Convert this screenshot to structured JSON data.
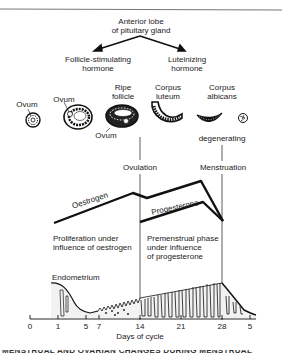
{
  "pituitary": {
    "title_line1": "Anterior lobe",
    "title_line2": "of pituitary gland",
    "fsh_line1": "Follicle-stimulating",
    "fsh_line2": "hormone",
    "lh_line1": "Luteinizing",
    "lh_line2": "hormone"
  },
  "ovary_stages": {
    "ovum_1": "Ovum",
    "ovum_2": "Ovum",
    "ripe_follicle_line1": "Ripe",
    "ripe_follicle_line2": "follicle",
    "ovum_3": "Ovum",
    "corpus_luteum_line1": "Corpus",
    "corpus_luteum_line2": "luteum",
    "corpus_albicans_line1": "Corpus",
    "corpus_albicans_line2": "albicans",
    "degenerating": "degenerating"
  },
  "events": {
    "ovulation": "Ovulation",
    "menstruation": "Menstruation"
  },
  "hormones": {
    "oestrogen": "Oestrogen",
    "progesterone": "Progesterone"
  },
  "phases": {
    "proliferation_line1": "Proliferation under",
    "proliferation_line2": "influence of oestrogen",
    "premenstrual_line1": "Premenstrual phase",
    "premenstrual_line2": "under influence",
    "premenstrual_line3": "of progesterone"
  },
  "endometrium": {
    "label": "Endometrium"
  },
  "axis": {
    "label": "Days of cycle",
    "ticks": [
      "0",
      "1",
      "5",
      "7",
      "14",
      "21",
      "28",
      "5"
    ]
  },
  "caption_partial": "MENSTRUAL AND OVARIAN CHANGES DURING MENSTRUAL"
}
